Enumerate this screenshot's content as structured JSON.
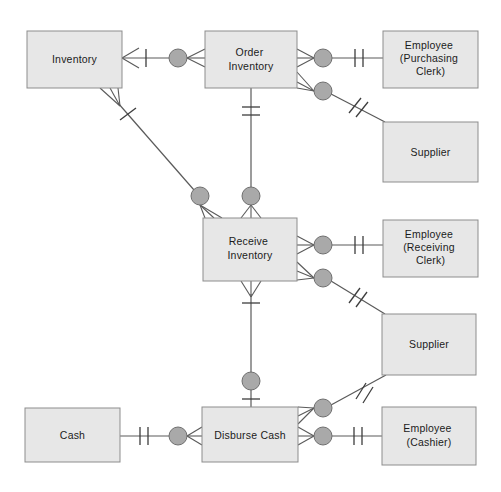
{
  "diagram": {
    "type": "entity-relationship-diagram",
    "canvas": {
      "width": 501,
      "height": 492,
      "background": "#ffffff"
    },
    "style": {
      "entity_fill": "#e7e7e7",
      "entity_stroke": "#8d8d8d",
      "relationship_circle_fill": "#a9a9a9",
      "relationship_circle_stroke": "#6f6f6f",
      "line_color": "#5a5a5a",
      "text_color": "#1b1b1b"
    },
    "entities": [
      {
        "id": "inventory",
        "label": "Inventory",
        "label_lines": [
          "Inventory"
        ],
        "x": 27,
        "y": 31,
        "w": 95,
        "h": 57
      },
      {
        "id": "order-inventory",
        "label": "Order Inventory",
        "label_lines": [
          "Order",
          "Inventory"
        ],
        "x": 205,
        "y": 31,
        "w": 92,
        "h": 57
      },
      {
        "id": "employee-purchasing-clerk",
        "label": "Employee (Purchasing Clerk)",
        "label_lines": [
          "Employee",
          "(Purchasing",
          "Clerk)"
        ],
        "x": 383,
        "y": 31,
        "w": 95,
        "h": 57
      },
      {
        "id": "supplier-top",
        "label": "Supplier",
        "label_lines": [
          "Supplier"
        ],
        "x": 383,
        "y": 122,
        "w": 95,
        "h": 60
      },
      {
        "id": "receive-inventory",
        "label": "Receive Inventory",
        "label_lines": [
          "Receive",
          "Inventory"
        ],
        "x": 203,
        "y": 218,
        "w": 94,
        "h": 63
      },
      {
        "id": "employee-receiving-clerk",
        "label": "Employee (Receiving Clerk)",
        "label_lines": [
          "Employee",
          "(Receiving",
          "Clerk)"
        ],
        "x": 383,
        "y": 220,
        "w": 95,
        "h": 57
      },
      {
        "id": "supplier-bottom",
        "label": "Supplier",
        "label_lines": [
          "Supplier"
        ],
        "x": 382,
        "y": 314,
        "w": 94,
        "h": 61
      },
      {
        "id": "cash",
        "label": "Cash",
        "label_lines": [
          "Cash"
        ],
        "x": 25,
        "y": 408,
        "w": 95,
        "h": 54
      },
      {
        "id": "disburse-cash",
        "label": "Disburse Cash",
        "label_lines": [
          "Disburse Cash"
        ],
        "x": 202,
        "y": 407,
        "w": 96,
        "h": 55
      },
      {
        "id": "employee-cashier",
        "label": "Employee (Cashier)",
        "label_lines": [
          "Employee",
          "(Cashier)"
        ],
        "x": 382,
        "y": 407,
        "w": 94,
        "h": 58
      }
    ],
    "relationship_nodes": [
      {
        "id": "node-inventory-order",
        "cx": 178,
        "cy": 58,
        "r": 9
      },
      {
        "id": "node-order-employee",
        "cx": 323,
        "cy": 58,
        "r": 9
      },
      {
        "id": "node-order-supplier",
        "cx": 323,
        "cy": 91,
        "r": 9
      },
      {
        "id": "node-inventory-receive",
        "cx": 200,
        "cy": 196,
        "r": 9
      },
      {
        "id": "node-order-receive",
        "cx": 251,
        "cy": 196,
        "r": 9
      },
      {
        "id": "node-receive-employee",
        "cx": 323,
        "cy": 245,
        "r": 9
      },
      {
        "id": "node-receive-supplier",
        "cx": 323,
        "cy": 278,
        "r": 9
      },
      {
        "id": "node-receive-disburse",
        "cx": 251,
        "cy": 381,
        "r": 9
      },
      {
        "id": "node-disburse-supplier",
        "cx": 323,
        "cy": 408,
        "r": 9
      },
      {
        "id": "node-disburse-employee",
        "cx": 323,
        "cy": 436,
        "r": 9
      },
      {
        "id": "node-cash-disburse",
        "cx": 178,
        "cy": 436,
        "r": 9
      }
    ],
    "relationships": [
      {
        "id": "rel-inventory-order-inventory",
        "from": "inventory",
        "to": "order-inventory",
        "node": "node-inventory-order",
        "from_cardinality": "many-one",
        "to_cardinality": "many"
      },
      {
        "id": "rel-order-inventory-employee",
        "from": "order-inventory",
        "to": "employee-purchasing-clerk",
        "node": "node-order-employee",
        "from_cardinality": "many",
        "to_cardinality": "one-one"
      },
      {
        "id": "rel-order-inventory-supplier",
        "from": "order-inventory",
        "to": "supplier-top",
        "node": "node-order-supplier",
        "from_cardinality": "many",
        "to_cardinality": "one-one"
      },
      {
        "id": "rel-inventory-receive-inventory",
        "from": "inventory",
        "to": "receive-inventory",
        "node": "node-inventory-receive",
        "from_cardinality": "many-one",
        "to_cardinality": "many"
      },
      {
        "id": "rel-order-inventory-receive-inventory",
        "from": "order-inventory",
        "to": "receive-inventory",
        "node": "node-order-receive",
        "from_cardinality": "one-one",
        "to_cardinality": "many"
      },
      {
        "id": "rel-receive-inventory-employee",
        "from": "receive-inventory",
        "to": "employee-receiving-clerk",
        "node": "node-receive-employee",
        "from_cardinality": "many",
        "to_cardinality": "one-one"
      },
      {
        "id": "rel-receive-inventory-supplier",
        "from": "receive-inventory",
        "to": "supplier-bottom",
        "node": "node-receive-supplier",
        "from_cardinality": "many",
        "to_cardinality": "one-one"
      },
      {
        "id": "rel-receive-inventory-disburse-cash",
        "from": "receive-inventory",
        "to": "disburse-cash",
        "node": "node-receive-disburse",
        "from_cardinality": "many",
        "to_cardinality": "one"
      },
      {
        "id": "rel-disburse-cash-supplier",
        "from": "disburse-cash",
        "to": "supplier-bottom",
        "node": "node-disburse-supplier",
        "from_cardinality": "many",
        "to_cardinality": "one-one"
      },
      {
        "id": "rel-disburse-cash-employee",
        "from": "disburse-cash",
        "to": "employee-cashier",
        "node": "node-disburse-employee",
        "from_cardinality": "many",
        "to_cardinality": "one-one"
      },
      {
        "id": "rel-cash-disburse-cash",
        "from": "cash",
        "to": "disburse-cash",
        "node": "node-cash-disburse",
        "from_cardinality": "one-one",
        "to_cardinality": "many"
      }
    ]
  }
}
